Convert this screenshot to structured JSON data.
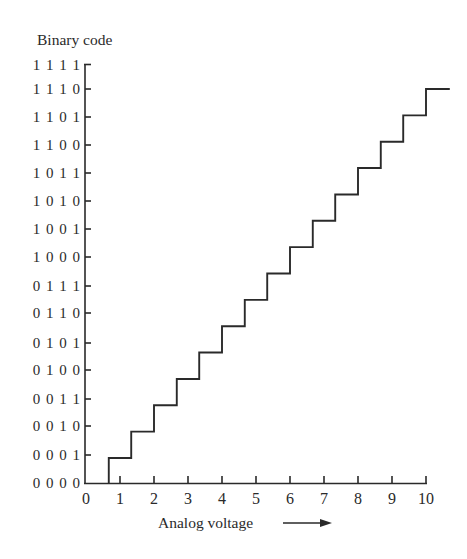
{
  "chart_data": {
    "type": "line",
    "subtype": "step",
    "title": "",
    "ylabel": "Binary code",
    "xlabel": "Analog voltage",
    "xlabel_arrow": "→",
    "x_ticks": [
      "0",
      "1",
      "2",
      "3",
      "4",
      "5",
      "6",
      "7",
      "8",
      "9",
      "10"
    ],
    "xlim": [
      0,
      10.7
    ],
    "y_ticks": [
      "0000",
      "0001",
      "0010",
      "0011",
      "0100",
      "0101",
      "0110",
      "0111",
      "1000",
      "1001",
      "1010",
      "1011",
      "1100",
      "1101",
      "1110",
      "1111"
    ],
    "grid": false,
    "legend": null,
    "series": [
      {
        "name": "ADC transfer characteristic",
        "transition_voltages": [
          0.67,
          1.33,
          2.0,
          2.67,
          3.33,
          4.0,
          4.67,
          5.33,
          6.0,
          6.67,
          7.33,
          8.0,
          8.67,
          9.33,
          10.0
        ],
        "step_count": 15,
        "start_code": "0000",
        "step_size_v": 0.667,
        "end_voltage": 10.7
      }
    ]
  },
  "axes": {
    "y_title": "Binary code",
    "x_title": "Analog voltage",
    "y_tick_labels": [
      "1111",
      "1110",
      "1101",
      "1100",
      "1011",
      "1010",
      "1001",
      "1000",
      "0111",
      "0110",
      "0101",
      "0100",
      "0011",
      "0010",
      "0001",
      "0000"
    ],
    "x_tick_labels": [
      "0",
      "1",
      "2",
      "3",
      "4",
      "5",
      "6",
      "7",
      "8",
      "9",
      "10"
    ]
  },
  "colors": {
    "line": "#2a2a2a",
    "background": "#ffffff"
  }
}
